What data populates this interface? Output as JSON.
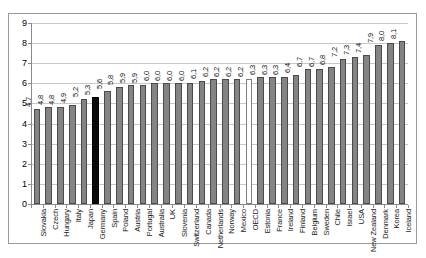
{
  "chart_data": {
    "type": "bar",
    "title": "",
    "subtitle": "",
    "xlabel": "",
    "ylabel": "",
    "ylim": [
      0,
      9
    ],
    "y_ticks": [
      0,
      1,
      2,
      3,
      4,
      5,
      6,
      7,
      8,
      9
    ],
    "grid": true,
    "legend": "none",
    "decimal_separator": ",",
    "value_labels_rotated": true,
    "categories": [
      "Slovakia",
      "Czech",
      "Hungary",
      "Italy",
      "Japan",
      "Germany",
      "Spain",
      "Poland",
      "Austria",
      "Portugal",
      "Australia",
      "UK",
      "Slovenia",
      "Switzerland",
      "Canada",
      "Netherlands",
      "Norway",
      "Mexico",
      "OECD",
      "Estonia",
      "France",
      "Ireland",
      "Finland",
      "Belgium",
      "Sweden",
      "Chile",
      "Israel",
      "USA",
      "New Zealand",
      "Denmark",
      "Korea",
      "Iceland"
    ],
    "values": [
      4.7,
      4.8,
      4.8,
      4.9,
      5.2,
      5.3,
      5.6,
      5.8,
      5.9,
      5.9,
      6.0,
      6.0,
      6.0,
      6.0,
      6.1,
      6.2,
      6.2,
      6.2,
      6.2,
      6.3,
      6.3,
      6.3,
      6.4,
      6.7,
      6.7,
      6.8,
      7.2,
      7.3,
      7.4,
      7.9,
      8.0,
      8.1
    ],
    "value_labels": [
      "4,7",
      "4,8",
      "4,8",
      "4,9",
      "5,2",
      "5,3",
      "5,6",
      "5,8",
      "5,9",
      "5,9",
      "6,0",
      "6,0",
      "6,0",
      "6,0",
      "6,1",
      "6,2",
      "6,2",
      "6,2",
      "6,2",
      "6,3",
      "6,3",
      "6,3",
      "6,4",
      "6,7",
      "6,7",
      "6,8",
      "7,2",
      "7,3",
      "7,4",
      "7,9",
      "8,0",
      "8,1"
    ],
    "y_tick_labels": [
      "0",
      "1",
      "2",
      "3",
      "4",
      "5",
      "6",
      "7",
      "8",
      "9"
    ],
    "bar_styles": [
      "normal",
      "normal",
      "normal",
      "normal",
      "normal",
      "highlight",
      "normal",
      "normal",
      "normal",
      "normal",
      "normal",
      "normal",
      "normal",
      "normal",
      "normal",
      "normal",
      "normal",
      "normal",
      "reference",
      "normal",
      "normal",
      "normal",
      "normal",
      "normal",
      "normal",
      "normal",
      "normal",
      "normal",
      "normal",
      "normal",
      "normal",
      "normal"
    ],
    "colors": {
      "bar_fill": "#848484",
      "bar_border": "#4a4a4a",
      "highlight_fill": "#0a0a0a",
      "reference_fill": "#ffffff",
      "gridline": "#c8c8c8",
      "axis": "#8a8a8a",
      "frame": "#9a9a9a",
      "background": "#ffffff"
    }
  }
}
